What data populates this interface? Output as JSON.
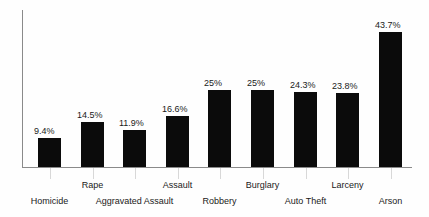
{
  "chart_data": {
    "type": "bar",
    "title": "",
    "subtitle": "",
    "xlabel": "",
    "ylabel": "",
    "categories": [
      "Homicide",
      "Rape",
      "Aggravated Assault",
      "Assault",
      "Robbery",
      "Burglary",
      "Auto Theft",
      "Larceny",
      "Arson"
    ],
    "values": [
      9.4,
      14.5,
      11.9,
      16.6,
      25,
      25,
      24.3,
      23.8,
      43.7
    ],
    "value_labels": [
      "9.4%",
      "14.5%",
      "11.9%",
      "16.6%",
      "25%",
      "25%",
      "24.3%",
      "23.8%",
      "43.7%"
    ],
    "ylim": [
      0,
      50
    ],
    "grid": false,
    "legend": false,
    "legend_position": "none",
    "bar_color": "#0b0b0b",
    "axis_color": "#8a8a8a",
    "background_color": "#fefefe",
    "text_color": "#1a1a1a",
    "label_rows": [
      "low",
      "high",
      "low",
      "high",
      "low",
      "high",
      "low",
      "high",
      "low"
    ]
  }
}
